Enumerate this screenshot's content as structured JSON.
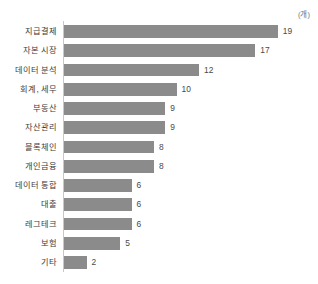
{
  "chart": {
    "unit_label": "(개)",
    "axis_color": "#c8c8c8",
    "bar_color": "#8b8b8b",
    "label_color": "#3b3b3b",
    "value_color": "#4a4a4a",
    "background": "#ffffff"
  },
  "chart_data": {
    "type": "bar",
    "orientation": "horizontal",
    "title": "",
    "subtitle": "",
    "xlabel": "",
    "ylabel": "",
    "unit": "(개)",
    "grid": false,
    "legend": false,
    "legend_position": "none",
    "xlim": [
      0,
      19
    ],
    "categories": [
      "지급결제",
      "자본 시장",
      "데이터 분석",
      "회계, 세무",
      "부동산",
      "자산관리",
      "블록체인",
      "개인금융",
      "데이터 통합",
      "대출",
      "레그테크",
      "보험",
      "기타"
    ],
    "values": [
      19,
      17,
      12,
      10,
      9,
      9,
      8,
      8,
      6,
      6,
      6,
      5,
      2
    ],
    "value_labels": [
      "19",
      "17",
      "12",
      "10",
      "9",
      "9",
      "8",
      "8",
      "6",
      "6",
      "6",
      "5",
      "2"
    ]
  }
}
